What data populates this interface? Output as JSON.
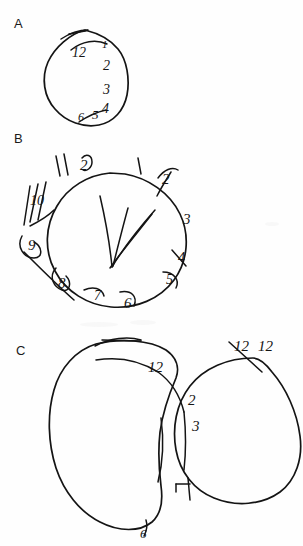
{
  "document": {
    "title": "Clock Drawing Test",
    "description": "Three hand-drawn clock face attempts labelled A, B and C, drawn in black ink on white paper.",
    "background_color": "#fefefe",
    "ink_color": "#141414"
  },
  "panels": [
    {
      "id": "A",
      "label": "A",
      "label_position": {
        "x": 14,
        "y": 16
      },
      "shape": "single closed circle",
      "description": "A roughly circular clock face with all numerals crowded into the right half; the left half is empty.",
      "numerals": [
        {
          "text": "12",
          "x": 76,
          "y": 52
        },
        {
          "text": "1",
          "x": 104,
          "y": 44
        },
        {
          "text": "2",
          "x": 105,
          "y": 66
        },
        {
          "text": "3",
          "x": 105,
          "y": 90
        },
        {
          "text": "4",
          "x": 104,
          "y": 111
        },
        {
          "text": "5",
          "x": 95,
          "y": 115
        },
        {
          "text": "6",
          "x": 81,
          "y": 118
        }
      ],
      "hands": "none"
    },
    {
      "id": "B",
      "label": "B",
      "label_position": {
        "x": 14,
        "y": 131
      },
      "shape": "single closed circle",
      "description": "A clock face with numerals written outside the circle, overlapping and scribbled; two clock hands are drawn inside meeting off-centre.",
      "numerals": [
        {
          "text": "11",
          "x": 57,
          "y": 165
        },
        {
          "text": "12",
          "x": 85,
          "y": 162
        },
        {
          "text": "1",
          "x": 137,
          "y": 161
        },
        {
          "text": "2",
          "x": 168,
          "y": 175
        },
        {
          "text": "3",
          "x": 190,
          "y": 215
        },
        {
          "text": "4",
          "x": 190,
          "y": 260
        },
        {
          "text": "5",
          "x": 172,
          "y": 283
        },
        {
          "text": "6",
          "x": 130,
          "y": 300
        },
        {
          "text": "7",
          "x": 98,
          "y": 297
        },
        {
          "text": "8",
          "x": 62,
          "y": 281
        },
        {
          "text": "9",
          "x": 36,
          "y": 243
        },
        {
          "text": "10",
          "x": 37,
          "y": 198
        }
      ],
      "hands": "two hands meeting below centre"
    },
    {
      "id": "C",
      "label": "C",
      "label_position": {
        "x": 16,
        "y": 343
      },
      "shape": "two overlapping circles",
      "description": "Two large overlapping circles; the drawing was restarted, leaving a big left circle and a second circle on the right with numerals 12, 12, 2, 3 and a 6 at the bottom.",
      "numerals": [
        {
          "text": "12",
          "x": 152,
          "y": 366
        },
        {
          "text": "12",
          "x": 240,
          "y": 345
        },
        {
          "text": "12",
          "x": 262,
          "y": 345
        },
        {
          "text": "2",
          "x": 192,
          "y": 399
        },
        {
          "text": "3",
          "x": 196,
          "y": 424
        },
        {
          "text": "6",
          "x": 145,
          "y": 531
        }
      ],
      "hands": "none"
    }
  ]
}
